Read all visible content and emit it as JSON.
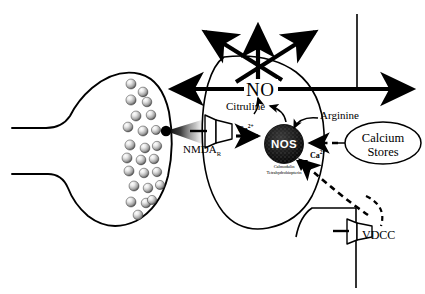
{
  "diagram": {
    "colors": {
      "ink": "#000000",
      "background": "#ffffff",
      "vesicle_light": "#f2f2f2",
      "vesicle_mid": "#9a9a9a",
      "vesicle_dark": "#3a3a3a",
      "nos_fill": "#1a1a1a",
      "nos_text": "#ffffff"
    },
    "labels": {
      "no": "NO",
      "citruline": "Citruline",
      "arginine": "Arginine",
      "nmda": "NMDA",
      "nmda_subscript": "R",
      "nos": "NOS",
      "cofactor_line1": "Calmodulin",
      "cofactor_line2": "Tetrahydrobiopterin",
      "calcium_line1": "Calcium",
      "calcium_line2": "Stores",
      "vdcc": "VDCC",
      "calcium_ion_influx": "Ca",
      "calcium_ion_influx_charge": "2+",
      "calcium_ion_release": "Ca",
      "calcium_ion_release_charge": "2+"
    },
    "structures": [
      {
        "name": "presynaptic-terminal",
        "description": "Axon terminal bulb containing synaptic vesicles"
      },
      {
        "name": "synaptic-vesicles",
        "count": 25,
        "description": "Shaded spheres clustered at the active zone"
      },
      {
        "name": "neurotransmitter-release-plume",
        "description": "Gradient cone of released transmitter crossing the synaptic cleft"
      },
      {
        "name": "postsynaptic-neuron",
        "description": "Large oval postsynaptic cell body"
      },
      {
        "name": "nmda-receptor-channel",
        "description": "Funnel-shaped ligand-gated calcium channel"
      },
      {
        "name": "nos-enzyme",
        "description": "Nitric oxide synthase, stippled dark sphere"
      },
      {
        "name": "calcium-stores",
        "description": "Intracellular calcium store ellipse"
      },
      {
        "name": "vdcc-channel",
        "description": "Voltage-dependent calcium channel on adjacent process"
      },
      {
        "name": "neighbouring-process",
        "description": "Vertical neurite / vessel at upper right"
      }
    ],
    "arrows": {
      "no_diffusion": [
        {
          "name": "no-arrow-left",
          "direction": "left"
        },
        {
          "name": "no-arrow-upper-left",
          "direction": "upper-left"
        },
        {
          "name": "no-arrow-up",
          "direction": "up"
        },
        {
          "name": "no-arrow-upper-right",
          "direction": "upper-right"
        },
        {
          "name": "no-arrow-right",
          "direction": "right"
        }
      ],
      "conversion": "Arginine is converted by NOS to Citruline plus NO",
      "calcium_flow": "Calcium enters through NMDA receptor and VDCC and is released from calcium stores onto NOS"
    }
  }
}
